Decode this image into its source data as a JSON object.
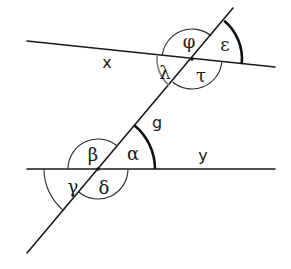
{
  "diagram": {
    "lines": {
      "upper_line_label": "x",
      "lower_line_label": "y",
      "transversal_label": "g"
    },
    "angles": {
      "upper_intersection": {
        "phi": "φ",
        "epsilon": "ε",
        "lambda": "λ",
        "tau": "τ"
      },
      "lower_intersection": {
        "beta": "β",
        "alpha": "α",
        "gamma": "γ",
        "delta": "δ"
      }
    },
    "colors": {
      "stroke": "#1a1a1a",
      "highlight_gray": "#8a8a8a",
      "background": "#ffffff"
    }
  }
}
